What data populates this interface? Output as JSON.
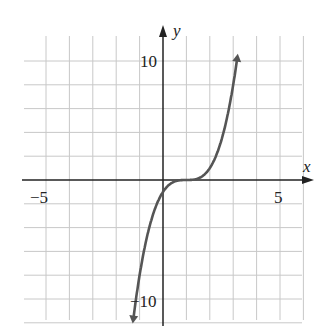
{
  "chart_data": {
    "type": "line",
    "title": "",
    "xlabel": "x",
    "ylabel": "y",
    "xlim": [
      -6,
      6
    ],
    "ylim": [
      -12,
      12
    ],
    "grid": true,
    "x_grid_step": 1,
    "y_grid_step": 2,
    "x_tick_labels": [
      {
        "value": -5,
        "label": "−5"
      },
      {
        "value": 5,
        "label": "5"
      }
    ],
    "y_tick_labels": [
      {
        "value": 10,
        "label": "10"
      },
      {
        "value": -10,
        "label": "−10"
      }
    ],
    "series": [
      {
        "name": "curve",
        "function": "y = (x - 1)^3",
        "x": [
          -1.3,
          -1,
          -0.5,
          0,
          0.5,
          1,
          1.5,
          2,
          2.5,
          3,
          3.2
        ],
        "y": [
          -12.2,
          -8,
          -3.4,
          -1,
          -0.1,
          0,
          0.1,
          1,
          3.4,
          8,
          10.6
        ],
        "arrows_at_ends": true,
        "color": "#555555"
      }
    ]
  },
  "axes": {
    "x_label": "x",
    "y_label": "y"
  },
  "ticks": {
    "x_neg": "−5",
    "x_pos": "5",
    "y_pos": "10",
    "y_neg": "−10"
  }
}
